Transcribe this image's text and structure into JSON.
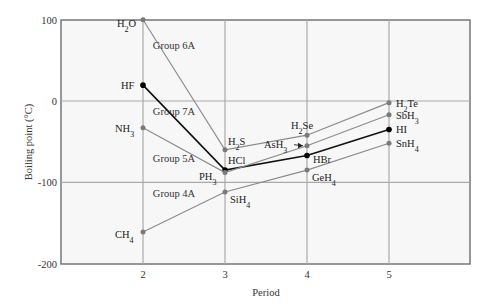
{
  "chart_data": {
    "type": "line",
    "title": "",
    "xlabel": "Period",
    "ylabel": "Boiling point (°C)",
    "x": [
      2,
      3,
      4,
      5
    ],
    "x_ticks": [
      "2",
      "3",
      "4",
      "5"
    ],
    "y_ticks": [
      "100",
      "0",
      "-100",
      "-200"
    ],
    "ylim": [
      -200,
      100
    ],
    "xlim": [
      1.3,
      6.0
    ],
    "grid": true,
    "series": [
      {
        "name": "Group 6A",
        "color": "#8a8a8a",
        "highlight": false,
        "values": [
          100,
          -60,
          -42,
          -2
        ],
        "labels": [
          "H₂O",
          "H₂S",
          "H₂Se",
          "H₂Te"
        ]
      },
      {
        "name": "Group 7A",
        "color": "#111111",
        "highlight": true,
        "values": [
          19.5,
          -85,
          -67,
          -35
        ],
        "labels": [
          "HF",
          "HCl",
          "HBr",
          "HI"
        ]
      },
      {
        "name": "Group 5A",
        "color": "#8a8a8a",
        "highlight": false,
        "values": [
          -33,
          -88,
          -55,
          -17
        ],
        "labels": [
          "NH₃",
          "PH₃",
          "AsH₃",
          "SbH₃"
        ]
      },
      {
        "name": "Group 4A",
        "color": "#8a8a8a",
        "highlight": false,
        "values": [
          -161,
          -112,
          -85,
          -52
        ],
        "labels": [
          "CH₄",
          "SiH₄",
          "GeH₄",
          "SnH₄"
        ]
      }
    ],
    "annotations": [
      {
        "text": "Group 6A",
        "x": 2.12,
        "y": 64
      },
      {
        "text": "Group 7A",
        "x": 2.12,
        "y": -17
      },
      {
        "text": "Group 5A",
        "x": 2.12,
        "y": -75
      },
      {
        "text": "Group 4A",
        "x": 2.12,
        "y": -118
      }
    ]
  },
  "layout": {
    "plot": {
      "left": 61,
      "top": 20,
      "right": 470,
      "bottom": 264
    },
    "x_origin_px": 143,
    "x_step_px": 82,
    "y_zero_px": 101,
    "y_px_per_unit": 0.813,
    "background": "#f7f7f7",
    "grid_color": "#a9a9a9",
    "frame_color": "#777777"
  },
  "point_label_positions": {
    "H₂O": {
      "dx": -26,
      "dy": 7
    },
    "H₂S": {
      "dx": 3,
      "dy": -5
    },
    "H₂Se": {
      "dx": -16,
      "dy": -6
    },
    "H₂Te": {
      "dx": 7,
      "dy": 4
    },
    "HF": {
      "dx": -22,
      "dy": 4
    },
    "HCl": {
      "dx": 3,
      "dy": -6
    },
    "HBr": {
      "dx": 6,
      "dy": 8
    },
    "HI": {
      "dx": 7,
      "dy": 4
    },
    "NH₃": {
      "dx": -28,
      "dy": 4
    },
    "PH₃": {
      "dx": -26,
      "dy": 7
    },
    "AsH₃": {
      "dx": -43,
      "dy": 2,
      "arrow": true
    },
    "SbH₃": {
      "dx": 7,
      "dy": 4
    },
    "CH₄": {
      "dx": -28,
      "dy": 6
    },
    "SiH₄": {
      "dx": 5,
      "dy": 11
    },
    "GeH₄": {
      "dx": 5,
      "dy": 11
    },
    "SnH₄": {
      "dx": 7,
      "dy": 4
    }
  }
}
